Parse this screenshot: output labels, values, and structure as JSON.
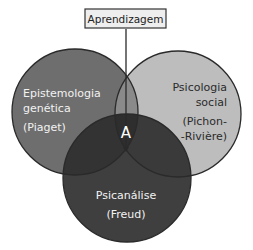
{
  "diagram": {
    "type": "venn",
    "top_label": "Aprendizagem",
    "intersection_label": "A",
    "sets": [
      {
        "id": "left",
        "lines": [
          "Epistemologia",
          "genética",
          "(Piaget)"
        ],
        "color": "#6e6e6e"
      },
      {
        "id": "right",
        "lines": [
          "Psicologia",
          "social",
          "(Pichon-",
          "-Rivière)"
        ],
        "color": "#bdbdbd"
      },
      {
        "id": "bottom",
        "lines": [
          "Psicanálise",
          "(Freud)"
        ],
        "color": "#3f3f3f"
      }
    ],
    "overlap_colors": {
      "left_right": "#8a8a8a",
      "left_bottom": "#333333",
      "right_bottom": "#3a3a3a",
      "all": "#2e2e2e"
    },
    "stroke_color": "#2a2a2a"
  }
}
